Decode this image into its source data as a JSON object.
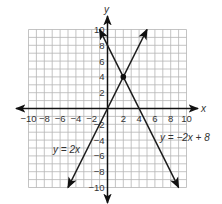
{
  "chart_data": {
    "type": "line",
    "title": "",
    "xlabel": "x",
    "ylabel": "y",
    "xlim": [
      -10,
      10
    ],
    "ylim": [
      -10,
      10
    ],
    "grid": true,
    "grid_step": 1,
    "x_ticks": [
      -10,
      -8,
      -6,
      -4,
      -2,
      2,
      4,
      6,
      8,
      10
    ],
    "y_ticks": [
      -10,
      -8,
      -6,
      -4,
      -2,
      2,
      4,
      6,
      8,
      10
    ],
    "x_tick_labels": [
      "−10",
      "−8",
      "−6",
      "−4",
      "−2",
      "2",
      "4",
      "6",
      "8",
      "10"
    ],
    "y_tick_labels": [
      "−10",
      "−8",
      "−6",
      "−4",
      "−2",
      "2",
      "4",
      "6",
      "8",
      "10"
    ],
    "series": [
      {
        "name": "y = 2x",
        "label": "y = 2x",
        "slope": 2,
        "intercept": 0,
        "x": [
          -5,
          5
        ],
        "y": [
          -10,
          10
        ],
        "arrows": "both"
      },
      {
        "name": "y = −2x + 8",
        "label": "y = −2x + 8",
        "slope": -2,
        "intercept": 8,
        "x": [
          -1,
          9
        ],
        "y": [
          10,
          -10
        ],
        "arrows": "both"
      }
    ],
    "annotations": [
      {
        "type": "point",
        "x": 2,
        "y": 4,
        "label": "intersection"
      }
    ],
    "legend": "inline labels near lines",
    "colors": {
      "grid": "#b5b5b5",
      "axes": "#111111",
      "lines": "#1a1a1a",
      "text": "#333333"
    }
  }
}
